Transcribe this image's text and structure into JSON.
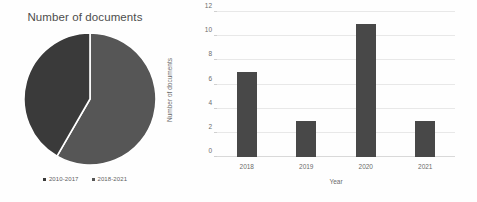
{
  "background_color": "#fefefe",
  "pie_panel": {
    "title": "Number of documents",
    "legend": [
      {
        "label": "2010-2017",
        "color": "#3a3a3a"
      },
      {
        "label": "2018-2021",
        "color": "#565656"
      }
    ]
  },
  "bar_panel": {
    "xlabel": "Year",
    "ylabel": "Number of documents"
  },
  "chart_data": [
    {
      "type": "pie",
      "title": "Number of documents",
      "labels": [
        "2010-2017",
        "2018-2021"
      ],
      "values": [
        10,
        14
      ],
      "percentages": [
        42,
        58
      ],
      "colors": [
        "#3a3a3a",
        "#565656"
      ],
      "start_angle": 0,
      "direction": "clockwise",
      "legend_position": "bottom"
    },
    {
      "type": "bar",
      "title": "",
      "categories": [
        "2018",
        "2019",
        "2020",
        "2021"
      ],
      "values": [
        7,
        3,
        11,
        3
      ],
      "xlabel": "Year",
      "ylabel": "Number of documents",
      "ylim": [
        0,
        12
      ],
      "yticks": [
        0,
        2,
        4,
        6,
        8,
        10,
        12
      ],
      "grid": true,
      "bar_color": "#484848",
      "legend_position": "none"
    }
  ]
}
